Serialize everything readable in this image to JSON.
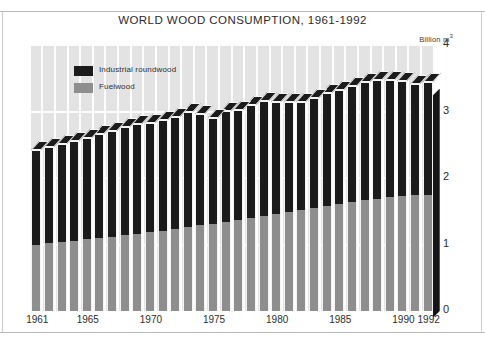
{
  "figure": {
    "title": "WORLD WOOD CONSUMPTION, 1961-1992",
    "unit_label": "Billion m",
    "unit_exp": "3"
  },
  "legend": {
    "position": "top-left-inside",
    "items": [
      {
        "label": "Industrial roundwood",
        "color": "#1b1b1b",
        "name": "industrial-roundwood"
      },
      {
        "label": "Fuelwood",
        "color": "#8e8e8e",
        "name": "fuelwood"
      }
    ]
  },
  "axes": {
    "y_ticks": [
      "0",
      "1",
      "2",
      "3",
      "4"
    ],
    "x_ticks": [
      "1961",
      "1965",
      "1970",
      "1975",
      "1980",
      "1985",
      "1990",
      "1992"
    ]
  },
  "chart_data": {
    "type": "bar",
    "subtype": "stacked-3d-column",
    "title": "WORLD WOOD CONSUMPTION, 1961-1992",
    "xlabel": "",
    "ylabel": "Billion m3",
    "ylim": [
      0,
      4
    ],
    "yticks": [
      0,
      1,
      2,
      3,
      4
    ],
    "grid": true,
    "legend_position": "upper left",
    "categories": [
      "1961",
      "1962",
      "1963",
      "1964",
      "1965",
      "1966",
      "1967",
      "1968",
      "1969",
      "1970",
      "1971",
      "1972",
      "1973",
      "1974",
      "1975",
      "1976",
      "1977",
      "1978",
      "1979",
      "1980",
      "1981",
      "1982",
      "1983",
      "1984",
      "1985",
      "1986",
      "1987",
      "1988",
      "1989",
      "1990",
      "1991",
      "1992"
    ],
    "xtick_labels": [
      "1961",
      "1965",
      "1970",
      "1975",
      "1980",
      "1985",
      "1990",
      "1992"
    ],
    "series": [
      {
        "name": "Fuelwood",
        "color": "#8e8e8e",
        "values": [
          1.0,
          1.02,
          1.04,
          1.06,
          1.08,
          1.1,
          1.12,
          1.14,
          1.16,
          1.19,
          1.21,
          1.24,
          1.26,
          1.29,
          1.31,
          1.34,
          1.37,
          1.4,
          1.43,
          1.46,
          1.49,
          1.52,
          1.55,
          1.58,
          1.61,
          1.64,
          1.67,
          1.69,
          1.71,
          1.73,
          1.74,
          1.75
        ]
      },
      {
        "name": "Industrial roundwood",
        "color": "#1b1b1b",
        "values": [
          1.42,
          1.44,
          1.47,
          1.5,
          1.52,
          1.56,
          1.59,
          1.62,
          1.65,
          1.64,
          1.66,
          1.68,
          1.73,
          1.68,
          1.6,
          1.67,
          1.66,
          1.7,
          1.73,
          1.69,
          1.65,
          1.63,
          1.66,
          1.7,
          1.71,
          1.74,
          1.77,
          1.78,
          1.77,
          1.73,
          1.67,
          1.7
        ]
      }
    ],
    "totals": [
      2.42,
      2.46,
      2.51,
      2.56,
      2.6,
      2.66,
      2.71,
      2.76,
      2.81,
      2.83,
      2.87,
      2.92,
      2.99,
      2.97,
      2.91,
      3.01,
      3.03,
      3.1,
      3.16,
      3.15,
      3.14,
      3.15,
      3.21,
      3.28,
      3.32,
      3.38,
      3.44,
      3.47,
      3.48,
      3.46,
      3.41,
      3.45
    ]
  }
}
